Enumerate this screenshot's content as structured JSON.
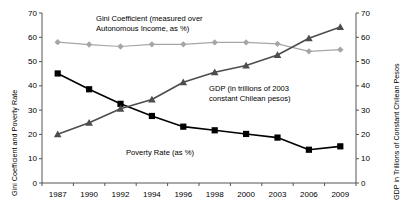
{
  "chart_data": {
    "type": "line",
    "title": "",
    "x": [
      "1987",
      "1990",
      "1992",
      "1994",
      "1996",
      "1998",
      "2000",
      "2003",
      "2006",
      "2009"
    ],
    "xlabel": "",
    "grid": false,
    "legend_position": "inline-annotations",
    "axes": {
      "left": {
        "label": "Gini Coefficient and Poverty Rate",
        "min": 0,
        "max": 70,
        "ticks": [
          0,
          10,
          20,
          30,
          40,
          50,
          60,
          70
        ]
      },
      "right": {
        "label": "GDP in Trillions of Constant Chilean Pesos",
        "min": 0,
        "max": 70,
        "ticks": [
          0,
          10,
          20,
          30,
          40,
          50,
          60,
          70
        ]
      },
      "bottom": {
        "ticks": [
          "1987",
          "1990",
          "1992",
          "1994",
          "1996",
          "1998",
          "2000",
          "2003",
          "2006",
          "2009"
        ]
      }
    },
    "series": [
      {
        "name": "Gini Coefficient (measured over Autonomous Income, as %)",
        "axis": "left",
        "color": "#a6a6a6",
        "marker": "diamond",
        "values": [
          58.0,
          57.0,
          56.2,
          57.1,
          57.1,
          57.9,
          57.9,
          57.3,
          54.2,
          54.9
        ]
      },
      {
        "name": "Poverty Rate (as %)",
        "axis": "left",
        "color": "#000000",
        "marker": "square",
        "values": [
          45.1,
          38.6,
          32.6,
          27.6,
          23.2,
          21.7,
          20.2,
          18.7,
          13.7,
          15.1
        ]
      },
      {
        "name": "GDP (in trillions of 2003 constant Chilean pesos)",
        "axis": "right",
        "color": "#4d4d4d",
        "marker": "triangle",
        "values": [
          20.1,
          24.8,
          30.6,
          34.4,
          41.5,
          45.6,
          48.4,
          52.7,
          59.6,
          64.2
        ]
      }
    ],
    "annotations": [
      {
        "id": "gini",
        "line1": "Gini Coefficient (measured over",
        "line2": "Autonomous Income, as %)"
      },
      {
        "id": "gdp",
        "line1": "GDP (in trillions of  2003",
        "line2": "constant  Chilean pesos)"
      },
      {
        "id": "poverty",
        "line1": "Poverty Rate (as %)",
        "line2": ""
      }
    ]
  }
}
